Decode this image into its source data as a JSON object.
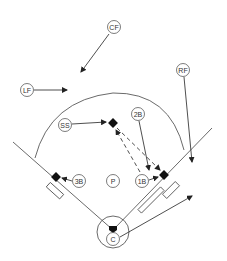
{
  "diagram": {
    "type": "baseball-field-positions",
    "colors": {
      "line": "#444444",
      "base": "#111111",
      "background": "#ffffff"
    },
    "players": [
      {
        "id": "CF",
        "label": "CF",
        "x": 114,
        "y": 27
      },
      {
        "id": "LF",
        "label": "LF",
        "x": 27,
        "y": 90
      },
      {
        "id": "RF",
        "label": "RF",
        "x": 183,
        "y": 70
      },
      {
        "id": "SS",
        "label": "SS",
        "x": 65,
        "y": 125
      },
      {
        "id": "2B",
        "label": "2B",
        "x": 138,
        "y": 114
      },
      {
        "id": "3B",
        "label": "3B",
        "x": 79,
        "y": 181
      },
      {
        "id": "P",
        "label": "P",
        "x": 113,
        "y": 181
      },
      {
        "id": "1B",
        "label": "1B",
        "x": 142,
        "y": 181
      },
      {
        "id": "C",
        "label": "C",
        "x": 113,
        "y": 239
      }
    ],
    "movements": [
      {
        "from": "CF",
        "to": "deep-left-center",
        "style": "solid"
      },
      {
        "from": "LF",
        "to": "left-field-gap",
        "style": "solid"
      },
      {
        "from": "RF",
        "to": "right-field-line",
        "style": "solid"
      },
      {
        "from": "SS",
        "to": "second-base",
        "style": "solid"
      },
      {
        "from": "2B",
        "to": "near-first-base",
        "style": "solid"
      },
      {
        "from": "3B",
        "to": "third-base",
        "style": "solid"
      },
      {
        "from": "1B",
        "to": "first-base",
        "style": "solid"
      },
      {
        "from": "C",
        "to": "right-field-foul",
        "style": "solid"
      },
      {
        "from": "second-base",
        "to": "first-base",
        "style": "dashed"
      },
      {
        "from": "first-base",
        "to": "second-base",
        "style": "dashed"
      }
    ]
  }
}
